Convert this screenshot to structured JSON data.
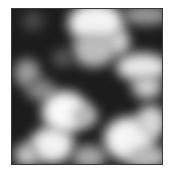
{
  "image": {
    "description": "grayscale cloud noise texture",
    "frame": {
      "x": 11,
      "y": 8,
      "width": 152,
      "height": 157,
      "border_color": "#3a3a3a",
      "base_color": "#1c1c1c"
    },
    "blobs": [
      {
        "x": 56,
        "y": -6,
        "w": 56,
        "h": 40,
        "color": "#f4f4f4"
      },
      {
        "x": 60,
        "y": 24,
        "w": 44,
        "h": 34,
        "color": "#bdbdbd"
      },
      {
        "x": 96,
        "y": 20,
        "w": 22,
        "h": 26,
        "color": "#d6d6d6"
      },
      {
        "x": 110,
        "y": -4,
        "w": 48,
        "h": 20,
        "color": "#9a9a9a"
      },
      {
        "x": 104,
        "y": 44,
        "w": 52,
        "h": 28,
        "color": "#e8e8e8"
      },
      {
        "x": 120,
        "y": 66,
        "w": 30,
        "h": 24,
        "color": "#cfcfcf"
      },
      {
        "x": 2,
        "y": 50,
        "w": 26,
        "h": 28,
        "color": "#9e9e9e"
      },
      {
        "x": 14,
        "y": 70,
        "w": 30,
        "h": 22,
        "color": "#8a8a8a"
      },
      {
        "x": 30,
        "y": 82,
        "w": 46,
        "h": 42,
        "color": "#fafafa"
      },
      {
        "x": 60,
        "y": 96,
        "w": 26,
        "h": 22,
        "color": "#b8b8b8"
      },
      {
        "x": 18,
        "y": 118,
        "w": 44,
        "h": 36,
        "color": "#f2f2f2"
      },
      {
        "x": 2,
        "y": 134,
        "w": 26,
        "h": 24,
        "color": "#c4c4c4"
      },
      {
        "x": 60,
        "y": 136,
        "w": 34,
        "h": 24,
        "color": "#a8a8a8"
      },
      {
        "x": 92,
        "y": 108,
        "w": 50,
        "h": 44,
        "color": "#f6f6f6"
      },
      {
        "x": 124,
        "y": 96,
        "w": 30,
        "h": 34,
        "color": "#d8d8d8"
      },
      {
        "x": 116,
        "y": 136,
        "w": 40,
        "h": 24,
        "color": "#bcbcbc"
      },
      {
        "x": 10,
        "y": 2,
        "w": 22,
        "h": 20,
        "color": "#4a4a4a"
      },
      {
        "x": 40,
        "y": 40,
        "w": 22,
        "h": 18,
        "color": "#5a5a5a"
      }
    ]
  }
}
